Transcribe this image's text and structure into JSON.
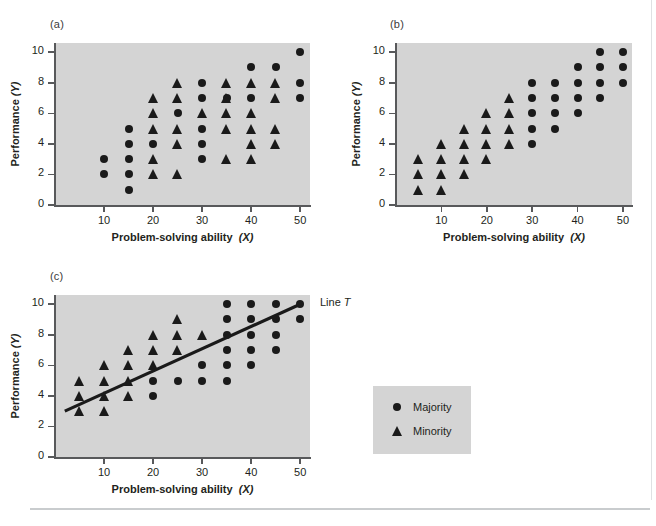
{
  "figure": {
    "axis": {
      "xlabel_text": "Problem-solving ability",
      "xlabel_var": "(X)",
      "ylabel_text": "Performance",
      "ylabel_var": "(Y)",
      "x_ticks": [
        10,
        20,
        30,
        40,
        50
      ],
      "y_ticks": [
        0,
        2,
        4,
        6,
        8,
        10
      ],
      "xlim": [
        0,
        52
      ],
      "ylim": [
        0,
        10.6
      ],
      "plot_background": "#d4d4d4",
      "marker_color": "#1a1a1a"
    },
    "panels": [
      {
        "tag": "(a)"
      },
      {
        "tag": "(b)"
      },
      {
        "tag": "(c)"
      }
    ],
    "line_label_text": "Line",
    "line_label_var": "T",
    "legend": {
      "majority_label": "Majority",
      "minority_label": "Minority",
      "majority_icon": "circle-marker-icon",
      "minority_icon": "triangle-marker-icon"
    }
  },
  "chart_data": [
    {
      "type": "scatter",
      "title": "(a)",
      "xlabel": "Problem-solving ability (X)",
      "ylabel": "Performance (Y)",
      "xlim": [
        0,
        52
      ],
      "ylim": [
        0,
        10.6
      ],
      "xticks": [
        10,
        20,
        30,
        40,
        50
      ],
      "yticks": [
        0,
        2,
        4,
        6,
        8,
        10
      ],
      "grid": false,
      "series": [
        {
          "name": "Majority",
          "marker": "circle",
          "points": [
            [
              10,
              3
            ],
            [
              10,
              2
            ],
            [
              15,
              5
            ],
            [
              15,
              4
            ],
            [
              15,
              3
            ],
            [
              15,
              2
            ],
            [
              15,
              1
            ],
            [
              20,
              4
            ],
            [
              25,
              6
            ],
            [
              30,
              8
            ],
            [
              30,
              7
            ],
            [
              30,
              5
            ],
            [
              30,
              4
            ],
            [
              30,
              3
            ],
            [
              35,
              7
            ],
            [
              40,
              9
            ],
            [
              40,
              7
            ],
            [
              45,
              9
            ],
            [
              50,
              10
            ],
            [
              50,
              8
            ],
            [
              50,
              7
            ]
          ]
        },
        {
          "name": "Minority",
          "marker": "triangle",
          "points": [
            [
              20,
              7
            ],
            [
              20,
              6
            ],
            [
              20,
              5
            ],
            [
              20,
              3
            ],
            [
              20,
              2
            ],
            [
              25,
              8
            ],
            [
              25,
              7
            ],
            [
              25,
              5
            ],
            [
              25,
              4
            ],
            [
              25,
              2
            ],
            [
              30,
              6
            ],
            [
              35,
              8
            ],
            [
              35,
              7
            ],
            [
              35,
              6
            ],
            [
              35,
              5
            ],
            [
              35,
              3
            ],
            [
              40,
              8
            ],
            [
              40,
              6
            ],
            [
              40,
              5
            ],
            [
              40,
              4
            ],
            [
              40,
              3
            ],
            [
              45,
              8
            ],
            [
              45,
              7
            ],
            [
              45,
              5
            ],
            [
              45,
              4
            ]
          ]
        }
      ]
    },
    {
      "type": "scatter",
      "title": "(b)",
      "xlabel": "Problem-solving ability (X)",
      "ylabel": "Performance (Y)",
      "xlim": [
        0,
        52
      ],
      "ylim": [
        0,
        10.6
      ],
      "xticks": [
        10,
        20,
        30,
        40,
        50
      ],
      "yticks": [
        0,
        2,
        4,
        6,
        8,
        10
      ],
      "grid": false,
      "series": [
        {
          "name": "Majority",
          "marker": "circle",
          "points": [
            [
              30,
              8
            ],
            [
              30,
              7
            ],
            [
              30,
              6
            ],
            [
              30,
              5
            ],
            [
              30,
              4
            ],
            [
              35,
              8
            ],
            [
              35,
              7
            ],
            [
              35,
              6
            ],
            [
              35,
              5
            ],
            [
              40,
              9
            ],
            [
              40,
              8
            ],
            [
              40,
              7
            ],
            [
              40,
              6
            ],
            [
              45,
              10
            ],
            [
              45,
              9
            ],
            [
              45,
              8
            ],
            [
              45,
              7
            ],
            [
              50,
              10
            ],
            [
              50,
              9
            ],
            [
              50,
              8
            ]
          ]
        },
        {
          "name": "Minority",
          "marker": "triangle",
          "points": [
            [
              5,
              3
            ],
            [
              5,
              2
            ],
            [
              5,
              1
            ],
            [
              10,
              4
            ],
            [
              10,
              3
            ],
            [
              10,
              2
            ],
            [
              10,
              1
            ],
            [
              15,
              5
            ],
            [
              15,
              4
            ],
            [
              15,
              3
            ],
            [
              15,
              2
            ],
            [
              20,
              6
            ],
            [
              20,
              5
            ],
            [
              20,
              4
            ],
            [
              20,
              3
            ],
            [
              25,
              7
            ],
            [
              25,
              6
            ],
            [
              25,
              5
            ],
            [
              25,
              4
            ]
          ]
        }
      ]
    },
    {
      "type": "scatter",
      "title": "(c)",
      "xlabel": "Problem-solving ability (X)",
      "ylabel": "Performance (Y)",
      "xlim": [
        0,
        52
      ],
      "ylim": [
        0,
        10.6
      ],
      "xticks": [
        10,
        20,
        30,
        40,
        50
      ],
      "yticks": [
        0,
        2,
        4,
        6,
        8,
        10
      ],
      "grid": false,
      "annotations": [
        {
          "text": "Line T",
          "x": 52,
          "y": 10
        }
      ],
      "trendline": {
        "name": "Line T",
        "x0": 2,
        "y0": 3,
        "x1": 50,
        "y1": 10
      },
      "series": [
        {
          "name": "Majority",
          "marker": "circle",
          "points": [
            [
              20,
              5
            ],
            [
              20,
              4
            ],
            [
              25,
              5
            ],
            [
              30,
              6
            ],
            [
              30,
              5
            ],
            [
              35,
              10
            ],
            [
              35,
              9
            ],
            [
              35,
              8
            ],
            [
              35,
              7
            ],
            [
              35,
              6
            ],
            [
              35,
              5
            ],
            [
              40,
              10
            ],
            [
              40,
              9
            ],
            [
              40,
              8
            ],
            [
              40,
              7
            ],
            [
              40,
              6
            ],
            [
              45,
              10
            ],
            [
              45,
              9
            ],
            [
              45,
              8
            ],
            [
              45,
              7
            ],
            [
              50,
              10
            ],
            [
              50,
              9
            ]
          ]
        },
        {
          "name": "Minority",
          "marker": "triangle",
          "points": [
            [
              5,
              5
            ],
            [
              5,
              4
            ],
            [
              5,
              3
            ],
            [
              10,
              6
            ],
            [
              10,
              5
            ],
            [
              10,
              4
            ],
            [
              10,
              3
            ],
            [
              15,
              7
            ],
            [
              15,
              6
            ],
            [
              15,
              5
            ],
            [
              15,
              4
            ],
            [
              20,
              8
            ],
            [
              20,
              7
            ],
            [
              20,
              6
            ],
            [
              25,
              9
            ],
            [
              25,
              8
            ],
            [
              25,
              7
            ],
            [
              30,
              8
            ]
          ]
        }
      ]
    }
  ]
}
